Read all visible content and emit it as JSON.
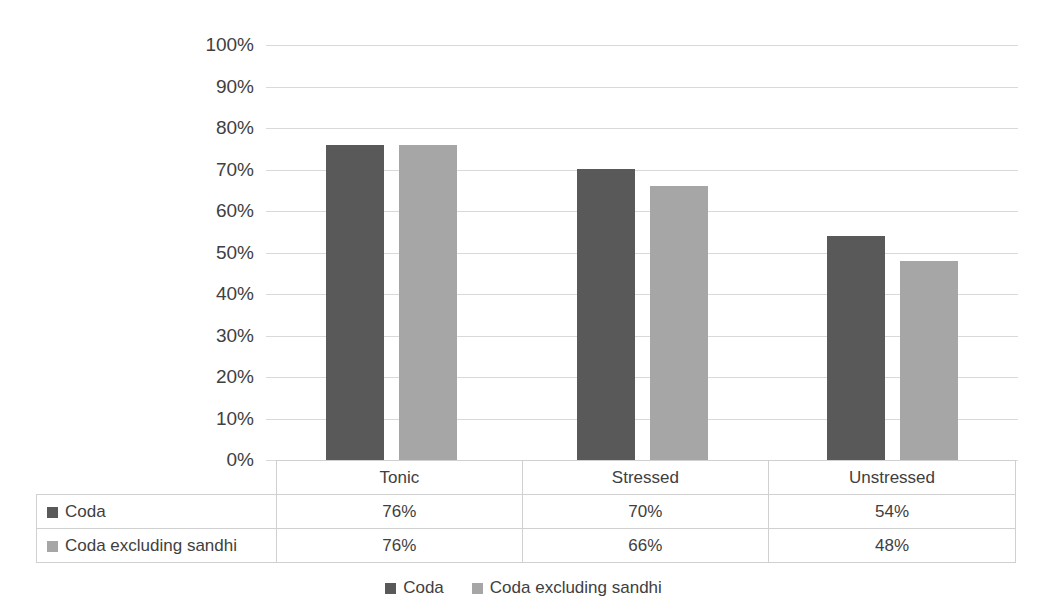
{
  "chart_data": {
    "type": "bar",
    "title": "",
    "xlabel": "",
    "ylabel": "",
    "categories": [
      "Tonic",
      "Stressed",
      "Unstressed"
    ],
    "series": [
      {
        "name": "Coda",
        "color": "#595959",
        "values": [
          76,
          70,
          54
        ],
        "labels": [
          "76%",
          "70%",
          "54%"
        ]
      },
      {
        "name": "Coda excluding sandhi",
        "color": "#a6a6a6",
        "values": [
          76,
          66,
          48
        ],
        "labels": [
          "76%",
          "66%",
          "48%"
        ]
      }
    ],
    "ylim": [
      0,
      100
    ],
    "yticks": [
      100,
      90,
      80,
      70,
      60,
      50,
      40,
      30,
      20,
      10,
      0
    ],
    "ytick_labels": [
      "100%",
      "90%",
      "80%",
      "70%",
      "60%",
      "50%",
      "40%",
      "30%",
      "20%",
      "10%",
      "0%"
    ],
    "grid": true,
    "legend_position": "bottom",
    "data_table_visible": true
  },
  "legend": {
    "entries": [
      {
        "label": "Coda",
        "color": "#595959"
      },
      {
        "label": "Coda excluding sandhi",
        "color": "#a6a6a6"
      }
    ]
  },
  "table": {
    "column_headers": [
      "",
      "Tonic",
      "Stressed",
      "Unstressed"
    ],
    "rows": [
      {
        "label": "Coda",
        "color": "#595959",
        "cells": [
          "76%",
          "70%",
          "54%"
        ]
      },
      {
        "label": "Coda excluding sandhi",
        "color": "#a6a6a6",
        "cells": [
          "76%",
          "66%",
          "48%"
        ]
      }
    ]
  },
  "colors": {
    "series_dark": "#595959",
    "series_light": "#a6a6a6",
    "gridline": "#d9d9d9",
    "text": "#404040",
    "table_border": "#d0d0d0"
  }
}
